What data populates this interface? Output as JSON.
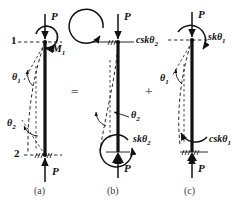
{
  "figure": {
    "type": "free-body-diagram",
    "width": 239,
    "height": 207,
    "background": "#ffffff",
    "ink": "#111111"
  },
  "operators": {
    "equals": "=",
    "plus": "+"
  },
  "captions": [
    {
      "key": "a",
      "text": "(a)"
    },
    {
      "key": "b",
      "text": "(b)"
    },
    {
      "key": "c",
      "text": "(c)"
    }
  ],
  "panels": [
    {
      "id": "a",
      "caption": "(a)",
      "node_labels": [
        {
          "name": "node-1",
          "text": "1"
        },
        {
          "name": "node-2",
          "text": "2"
        }
      ],
      "loads": [
        {
          "name": "axial-load-top",
          "text": "P",
          "direction": "down"
        },
        {
          "name": "axial-load-bottom",
          "text": "P",
          "direction": "up"
        }
      ],
      "moments": [
        {
          "name": "end-moment-M1",
          "text": "M",
          "sub": "1",
          "sense": "clockwise"
        }
      ],
      "angles": [
        {
          "name": "rotation-theta1",
          "text": "θ",
          "sub": "1"
        },
        {
          "name": "rotation-theta2",
          "text": "θ",
          "sub": "2"
        }
      ]
    },
    {
      "id": "b",
      "caption": "(b)",
      "node_labels": [],
      "loads": [
        {
          "name": "axial-load-top",
          "text": "P",
          "direction": "down"
        },
        {
          "name": "axial-load-bottom",
          "text": "P",
          "direction": "up"
        }
      ],
      "moments": [
        {
          "name": "carryover-moment-csktheta2",
          "text": "cskθ",
          "sub": "2",
          "sense": "counterclockwise"
        },
        {
          "name": "stiffness-moment-sktheta2",
          "text": "skθ",
          "sub": "2",
          "sense": "counterclockwise"
        }
      ],
      "angles": [
        {
          "name": "rotation-theta2",
          "text": "θ",
          "sub": "2"
        }
      ]
    },
    {
      "id": "c",
      "caption": "(c)",
      "node_labels": [],
      "loads": [
        {
          "name": "axial-load-top",
          "text": "P",
          "direction": "down"
        },
        {
          "name": "axial-load-bottom",
          "text": "P",
          "direction": "up"
        }
      ],
      "moments": [
        {
          "name": "stiffness-moment-sktheta1",
          "text": "skθ",
          "sub": "1",
          "sense": "clockwise"
        },
        {
          "name": "carryover-moment-csktheta1",
          "text": "cskθ",
          "sub": "1",
          "sense": "clockwise"
        }
      ],
      "angles": [
        {
          "name": "rotation-theta1",
          "text": "θ",
          "sub": "1"
        }
      ]
    }
  ],
  "text": {
    "P": "P",
    "M": "M",
    "theta": "θ",
    "one": "1",
    "two": "2",
    "cskTheta": "cskθ",
    "skTheta": "skθ",
    "cap_a": "(a)",
    "cap_b": "(b)",
    "cap_c": "(c)",
    "eq": "=",
    "plus": "+"
  }
}
